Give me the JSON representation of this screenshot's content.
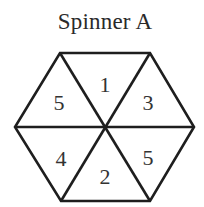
{
  "title": "Spinner A",
  "spinner": {
    "shape": "regular hexagon divided into 6 equilateral triangles",
    "center": [
      105,
      127
    ],
    "vertices": {
      "top_left": [
        60,
        53
      ],
      "top_right": [
        150,
        53
      ],
      "right": [
        194,
        127
      ],
      "bottom_right": [
        150,
        201
      ],
      "bottom_left": [
        61,
        201
      ],
      "left": [
        15,
        127
      ]
    },
    "sectors": [
      {
        "position": "top",
        "label": "1",
        "x": 105,
        "y": 92
      },
      {
        "position": "upper-right",
        "label": "3",
        "x": 148,
        "y": 110
      },
      {
        "position": "lower-right",
        "label": "5",
        "x": 148,
        "y": 165
      },
      {
        "position": "bottom",
        "label": "2",
        "x": 105,
        "y": 184
      },
      {
        "position": "lower-left",
        "label": "4",
        "x": 61,
        "y": 166
      },
      {
        "position": "upper-left",
        "label": "5",
        "x": 59,
        "y": 110
      }
    ],
    "line_color": "#1e1e1e",
    "label_color": "#333333"
  }
}
